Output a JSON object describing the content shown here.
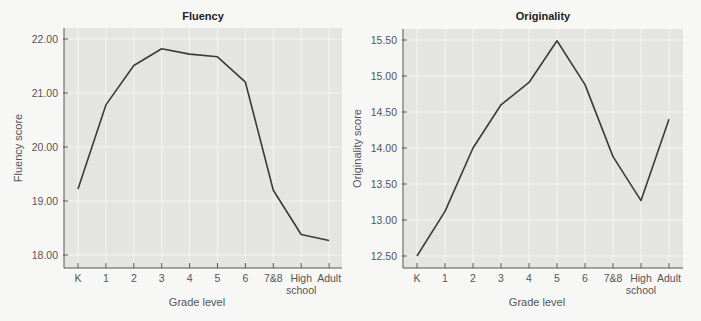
{
  "chart_data": [
    {
      "type": "line",
      "title": "Fluency",
      "xlabel": "Grade level",
      "ylabel": "Fluency score",
      "categories": [
        "K",
        "1",
        "2",
        "3",
        "4",
        "5",
        "6",
        "7&8",
        "High school",
        "Adult"
      ],
      "category_labels": [
        [
          "K"
        ],
        [
          "1"
        ],
        [
          "2"
        ],
        [
          "3"
        ],
        [
          "4"
        ],
        [
          "5"
        ],
        [
          "6"
        ],
        [
          "7&8"
        ],
        [
          "High",
          "school"
        ],
        [
          "Adult"
        ]
      ],
      "values": [
        19.22,
        20.78,
        21.51,
        21.82,
        21.72,
        21.67,
        21.2,
        19.2,
        18.38,
        18.27
      ],
      "yticks": [
        18.0,
        19.0,
        20.0,
        21.0,
        22.0
      ],
      "ytick_labels": [
        "18.00",
        "19.00",
        "20.00",
        "21.00",
        "22.00"
      ],
      "ylim": [
        17.8,
        22.2
      ],
      "grid": true,
      "legend": null,
      "line_color": "#3a3a3a",
      "plot_bg": "#e4e4e3"
    },
    {
      "type": "line",
      "title": "Originality",
      "xlabel": "Grade level",
      "ylabel": "Originality score",
      "categories": [
        "K",
        "1",
        "2",
        "3",
        "4",
        "5",
        "6",
        "7&8",
        "High school",
        "Adult"
      ],
      "category_labels": [
        [
          "K"
        ],
        [
          "1"
        ],
        [
          "2"
        ],
        [
          "3"
        ],
        [
          "4"
        ],
        [
          "5"
        ],
        [
          "6"
        ],
        [
          "7&8"
        ],
        [
          "High",
          "school"
        ],
        [
          "Adult"
        ]
      ],
      "values": [
        12.5,
        13.12,
        14.0,
        14.6,
        14.91,
        15.49,
        14.88,
        13.88,
        13.27,
        14.4
      ],
      "yticks": [
        12.5,
        13.0,
        13.5,
        14.0,
        14.5,
        15.0,
        15.5
      ],
      "ytick_labels": [
        "12.50",
        "13.00",
        "13.50",
        "14.00",
        "14.50",
        "15.00",
        "15.50"
      ],
      "ylim": [
        12.35,
        15.65
      ],
      "grid": true,
      "legend": null,
      "line_color": "#3a3a3a",
      "plot_bg": "#e4e4e3"
    }
  ]
}
